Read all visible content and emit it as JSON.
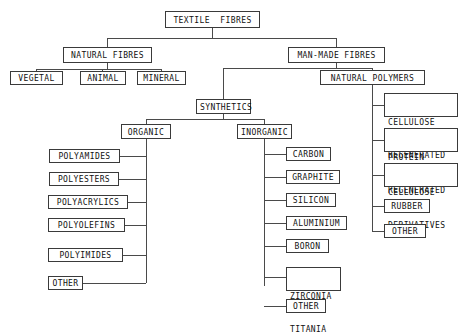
{
  "diagram": {
    "type": "hierarchy-tree",
    "root": {
      "label": "TEXTILE  FIBRES"
    },
    "level1": [
      {
        "label": "NATURAL FIBRES"
      },
      {
        "label": "MAN-MADE FIBRES"
      }
    ],
    "natural_children": [
      {
        "label": "VEGETAL"
      },
      {
        "label": "ANIMAL"
      },
      {
        "label": "MINERAL"
      }
    ],
    "manmade_children": [
      {
        "label": "SYNTHETICS"
      },
      {
        "label": "NATURAL POLYMERS"
      }
    ],
    "synthetics_children": [
      {
        "label": "ORGANIC"
      },
      {
        "label": "INORGANIC"
      }
    ],
    "organic_children": [
      {
        "label": "POLYAMIDES"
      },
      {
        "label": "POLYESTERS"
      },
      {
        "label": "POLYACRYLICS"
      },
      {
        "label": "POLYOLEFINS"
      },
      {
        "label": "POLYIMIDES"
      },
      {
        "label": "OTHER"
      }
    ],
    "inorganic_children": [
      {
        "label": "CARBON"
      },
      {
        "label": "GRAPHITE"
      },
      {
        "label": "SILICON"
      },
      {
        "label": "ALUMINIUM"
      },
      {
        "label": "BORON"
      },
      {
        "label_line1": "ZIRCONIA",
        "label_line2": "TITANIA"
      },
      {
        "label": "OTHER"
      }
    ],
    "natural_polymers_children": [
      {
        "label_line1": "CELLULOSE",
        "label_line2": "REGENERATED"
      },
      {
        "label_line1": "PROTEIN",
        "label_line2": "REGENERATED"
      },
      {
        "label_line1": "CELLULOSE",
        "label_line2": "DERIVATIVES"
      },
      {
        "label": "RUBBER"
      },
      {
        "label": "OTHER"
      }
    ],
    "colors": {
      "background": "#ffffff",
      "box_border": "#3a3a3a",
      "connector_line": "#4a4a4a",
      "text": "#111111"
    }
  }
}
